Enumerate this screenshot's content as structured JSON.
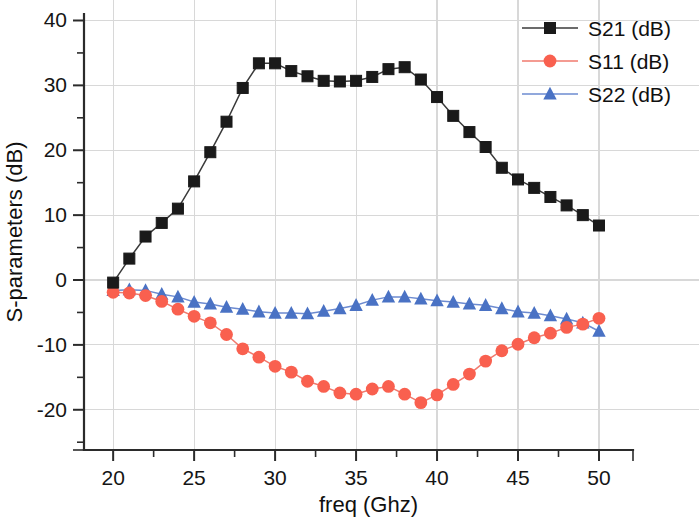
{
  "chart_data": {
    "type": "line",
    "title": "",
    "xlabel": "freq (Ghz)",
    "ylabel": "S-parameters (dB)",
    "xlim": [
      18.2,
      52.1
    ],
    "ylim": [
      -26.2,
      41.0
    ],
    "xticks": [
      20,
      25,
      30,
      35,
      40,
      45,
      50
    ],
    "xtick_labels": [
      "20",
      "25",
      "30",
      "35",
      "40",
      "45",
      "50"
    ],
    "xminor_step": 2.5,
    "yticks": [
      -20,
      -10,
      0,
      10,
      20,
      30,
      40
    ],
    "ytick_labels": [
      "-20",
      "-10",
      "0",
      "10",
      "20",
      "30",
      "40"
    ],
    "yminor_step": 5,
    "grid": true,
    "grid_color": "#d8d8d8",
    "legend_position": "top-right",
    "x": [
      20,
      21,
      22,
      23,
      24,
      25,
      26,
      27,
      28,
      29,
      30,
      31,
      32,
      33,
      34,
      35,
      36,
      37,
      38,
      39,
      40,
      41,
      42,
      43,
      44,
      45,
      46,
      47,
      48,
      49,
      50
    ],
    "series": [
      {
        "name": "S21 (dB)",
        "color": "#1a1a1a",
        "marker": "square",
        "line_color": "#3a3a3a",
        "values": [
          -0.4,
          3.3,
          6.7,
          8.8,
          11.0,
          15.2,
          19.7,
          24.4,
          29.6,
          33.4,
          33.4,
          32.2,
          31.4,
          30.7,
          30.6,
          30.7,
          31.3,
          32.5,
          32.8,
          30.9,
          28.2,
          25.3,
          22.8,
          20.5,
          17.3,
          15.5,
          14.2,
          12.8,
          11.5,
          10.0,
          8.4
        ]
      },
      {
        "name": "S11 (dB)",
        "color": "#f9604f",
        "marker": "circle",
        "line_color": "#f07a6e",
        "values": [
          -1.9,
          -2.0,
          -2.4,
          -3.3,
          -4.5,
          -5.6,
          -6.6,
          -8.4,
          -10.6,
          -11.9,
          -13.3,
          -14.2,
          -15.6,
          -16.4,
          -17.4,
          -17.6,
          -16.8,
          -16.4,
          -17.6,
          -18.9,
          -17.7,
          -16.1,
          -14.5,
          -12.5,
          -10.9,
          -9.9,
          -8.9,
          -8.2,
          -7.3,
          -6.8,
          -5.9
        ]
      },
      {
        "name": "S22 (dB)",
        "color": "#4a72c4",
        "marker": "triangle",
        "line_color": "#6d8bd0",
        "values": [
          -1.6,
          -1.5,
          -1.6,
          -2.2,
          -2.6,
          -3.4,
          -3.7,
          -4.2,
          -4.5,
          -4.9,
          -5.1,
          -5.1,
          -5.2,
          -4.8,
          -4.4,
          -3.9,
          -3.1,
          -2.6,
          -2.6,
          -2.9,
          -3.2,
          -3.4,
          -3.7,
          -3.9,
          -4.4,
          -4.9,
          -5.1,
          -5.5,
          -6.0,
          -6.6,
          -7.9
        ]
      }
    ]
  },
  "legend": {
    "entries": [
      {
        "label": "S21 (dB)",
        "color": "#1a1a1a",
        "marker": "square"
      },
      {
        "label": "S11 (dB)",
        "color": "#f9604f",
        "marker": "circle"
      },
      {
        "label": "S22 (dB)",
        "color": "#4a72c4",
        "marker": "triangle"
      }
    ]
  }
}
